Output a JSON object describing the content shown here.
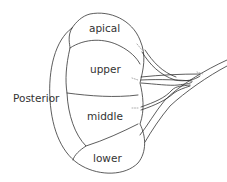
{
  "diagram": {
    "labels": {
      "side": "Posterior",
      "segments": [
        "apical",
        "upper",
        "middle",
        "lower"
      ]
    },
    "colors": {
      "line": "#333333",
      "text": "#333333",
      "background": "#ffffff"
    }
  }
}
